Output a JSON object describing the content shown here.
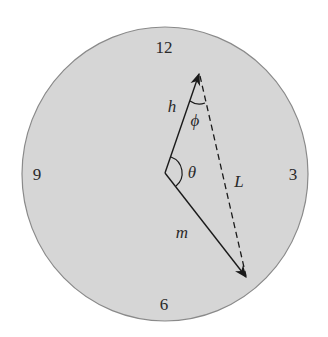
{
  "diagram": {
    "title": "",
    "clock": {
      "face_color": "#d6d6d6",
      "rim_color": "#8a8a8a",
      "numerals": {
        "twelve": "12",
        "three": "3",
        "six": "6",
        "nine": "9"
      }
    },
    "hands": {
      "hour": {
        "label": "h"
      },
      "minute": {
        "label": "m"
      },
      "distance": {
        "label": "L",
        "style": "dashed"
      }
    },
    "angles": {
      "theta": "θ",
      "phi": "ϕ"
    }
  }
}
